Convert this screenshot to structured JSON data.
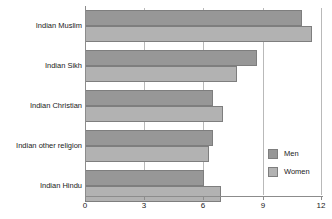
{
  "chart_data": {
    "type": "bar",
    "orientation": "horizontal",
    "title": "",
    "xlabel": "",
    "ylabel": "",
    "xlim": [
      0,
      12
    ],
    "xticks": [
      0,
      3,
      6,
      9,
      12
    ],
    "xtick_labels": [
      "0",
      "3",
      "6",
      "9",
      "12"
    ],
    "grid": true,
    "grid_axis": "x",
    "legend_position": "inside-bottom-right",
    "categories": [
      "Indian Muslim",
      "Indian Sikh",
      "Indian Christian",
      "Indian other religion",
      "Indian Hindu"
    ],
    "series": [
      {
        "name": "Men",
        "color": "#979797",
        "values": [
          11.0,
          8.7,
          6.5,
          6.5,
          6.0
        ]
      },
      {
        "name": "Women",
        "color": "#b2b2b2",
        "values": [
          11.5,
          7.7,
          7.0,
          6.3,
          6.9
        ]
      }
    ]
  },
  "legend": {
    "items": [
      {
        "label": "Men",
        "color": "#979797"
      },
      {
        "label": "Women",
        "color": "#b2b2b2"
      }
    ]
  },
  "axis": {
    "gridline_color": "#b9b9b9",
    "axis_color": "#8c8c8c"
  }
}
